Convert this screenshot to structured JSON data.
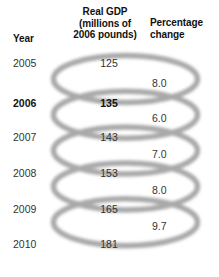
{
  "figure": {
    "type": "table-with-spiral-rings",
    "ring_color": "#a9a9a9",
    "text_color": "#333333",
    "background": "#ffffff"
  },
  "headers": {
    "year": "Year",
    "gdp_line1": "Real GDP",
    "gdp_line2": "(millions of",
    "gdp_line3": "2006 pounds)",
    "pct_line1": "Percentage",
    "pct_line2": "change"
  },
  "chart_data": {
    "type": "table",
    "columns": [
      "Year",
      "Real GDP (millions of 2006 pounds)",
      "Percentage change"
    ],
    "rows": [
      {
        "year": "2005",
        "gdp": "125",
        "pct": "8.0",
        "highlight": false
      },
      {
        "year": "2006",
        "gdp": "135",
        "pct": "6.0",
        "highlight": true
      },
      {
        "year": "2007",
        "gdp": "143",
        "pct": "7.0",
        "highlight": false
      },
      {
        "year": "2008",
        "gdp": "153",
        "pct": "8.0",
        "highlight": false
      },
      {
        "year": "2009",
        "gdp": "165",
        "pct": "9.7",
        "highlight": false
      },
      {
        "year": "2010",
        "gdp": "181",
        "pct": "",
        "highlight": false
      }
    ],
    "categories": [
      "2005",
      "2006",
      "2007",
      "2008",
      "2009",
      "2010"
    ],
    "series": [
      {
        "name": "Real GDP (millions of 2006 pounds)",
        "values": [
          125,
          135,
          143,
          153,
          165,
          181
        ]
      },
      {
        "name": "Percentage change",
        "values": [
          8.0,
          6.0,
          7.0,
          8.0,
          9.7,
          null
        ]
      }
    ],
    "xlabel": "Year",
    "ylabel": "Real GDP (millions of 2006 pounds)",
    "grid": false,
    "legend": "none",
    "annotations": [
      "Percentage-change values sit between consecutive year rows, linked by ring shapes."
    ]
  }
}
